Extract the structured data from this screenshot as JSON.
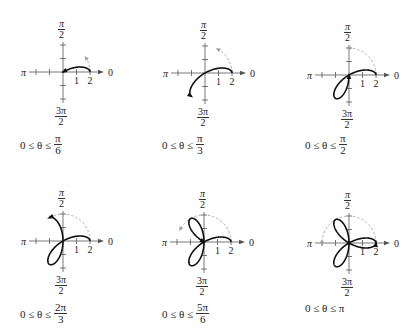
{
  "chart_data": {
    "type": "line",
    "title": "",
    "curve": "r = 2cos(3θ)",
    "coordinate_system": "polar",
    "axis_labels": {
      "right": "0",
      "top": {
        "num": "π",
        "den": "2"
      },
      "left": "π",
      "bottom": {
        "num": "3π",
        "den": "2"
      }
    },
    "tick_labels": [
      "1",
      "2"
    ],
    "panels": [
      {
        "origin": [
          63,
          72
        ],
        "theta_max_label": {
          "num": "π",
          "den": "6"
        },
        "theta_max": 0.5236,
        "range_text": "0 ≤ θ ≤"
      },
      {
        "origin": [
          205,
          73
        ],
        "theta_max_label": {
          "num": "π",
          "den": "3"
        },
        "theta_max": 1.0472,
        "range_text": "0 ≤ θ ≤"
      },
      {
        "origin": [
          349,
          75
        ],
        "theta_max_label": {
          "num": "π",
          "den": "2"
        },
        "theta_max": 1.5708,
        "range_text": "0 ≤ θ ≤"
      },
      {
        "origin": [
          63,
          241
        ],
        "theta_max_label": {
          "num": "2π",
          "den": "3"
        },
        "theta_max": 2.0944,
        "range_text": "0 ≤ θ ≤"
      },
      {
        "origin": [
          204,
          242
        ],
        "theta_max_label": {
          "num": "5π",
          "den": "6"
        },
        "theta_max": 2.618,
        "range_text": "0 ≤ θ ≤"
      },
      {
        "origin": [
          349,
          243
        ],
        "theta_max_label": {
          "text": "π"
        },
        "theta_max": 3.1416,
        "range_text": "0 ≤ θ ≤ π"
      }
    ],
    "unit_px": 13.5,
    "axis_range": [
      -3,
      3
    ],
    "grid": false,
    "legend": null
  },
  "colors": {
    "curve": "#111111",
    "axis": "#555555",
    "sweep": "#9a9a9a",
    "text": "#222222"
  }
}
